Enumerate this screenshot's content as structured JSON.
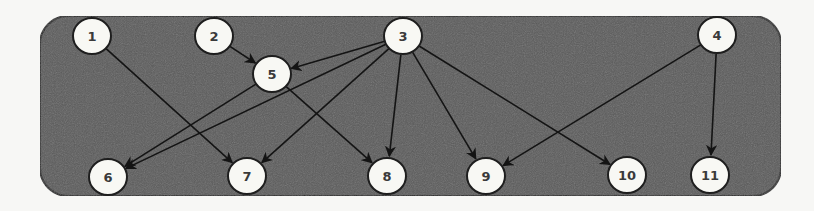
{
  "diagram": {
    "type": "directed-graph",
    "container": {
      "x": 40,
      "y": 16,
      "width": 741,
      "height": 180,
      "radius": 28,
      "fill": "#5b5b5b",
      "stroke": "#2a2a2a"
    },
    "node_style": {
      "radius": 19,
      "fill": "#f8f8f4",
      "stroke": "#1e1e1e"
    },
    "edge_color": "#141414",
    "nodes": [
      {
        "id": "1",
        "label": "1",
        "x": 92,
        "y": 36
      },
      {
        "id": "2",
        "label": "2",
        "x": 214,
        "y": 36
      },
      {
        "id": "3",
        "label": "3",
        "x": 403,
        "y": 36
      },
      {
        "id": "4",
        "label": "4",
        "x": 717,
        "y": 35
      },
      {
        "id": "5",
        "label": "5",
        "x": 272,
        "y": 74
      },
      {
        "id": "6",
        "label": "6",
        "x": 108,
        "y": 177
      },
      {
        "id": "7",
        "label": "7",
        "x": 247,
        "y": 176
      },
      {
        "id": "8",
        "label": "8",
        "x": 387,
        "y": 176
      },
      {
        "id": "9",
        "label": "9",
        "x": 486,
        "y": 176
      },
      {
        "id": "10",
        "label": "10",
        "x": 627,
        "y": 175
      },
      {
        "id": "11",
        "label": "11",
        "x": 710,
        "y": 175
      }
    ],
    "edges": [
      {
        "from": "1",
        "to": "7"
      },
      {
        "from": "2",
        "to": "5"
      },
      {
        "from": "3",
        "to": "5"
      },
      {
        "from": "3",
        "to": "6"
      },
      {
        "from": "3",
        "to": "7"
      },
      {
        "from": "3",
        "to": "8"
      },
      {
        "from": "3",
        "to": "9"
      },
      {
        "from": "3",
        "to": "10"
      },
      {
        "from": "4",
        "to": "9"
      },
      {
        "from": "4",
        "to": "11"
      },
      {
        "from": "5",
        "to": "6"
      },
      {
        "from": "5",
        "to": "8"
      }
    ]
  }
}
